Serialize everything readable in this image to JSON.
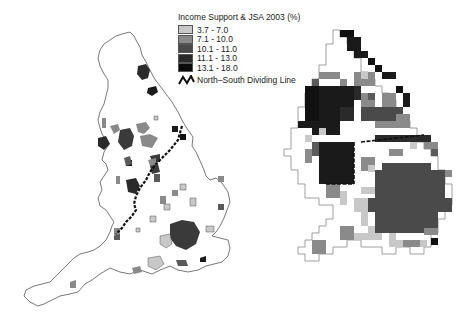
{
  "legend": {
    "title": "Income Support & JSA 2003 (%)",
    "classes": [
      {
        "label": "3.7  -  7.0",
        "color": "#c8c8c8"
      },
      {
        "label": "7.1  - 10.0",
        "color": "#8a8a8a"
      },
      {
        "label": "10.1 - 11.0",
        "color": "#4a4a4a"
      },
      {
        "label": "11.1 - 13.0",
        "color": "#2a2a2a"
      },
      {
        "label": "13.1 - 18.0",
        "color": "#0a0a0a"
      }
    ],
    "line_label": "North–South Dividing Line",
    "line_icon": "zigzag-line-icon"
  },
  "maps": {
    "left": {
      "name": "England geographic map",
      "outline_color": "#555555"
    },
    "right": {
      "name": "England grid cartogram",
      "outline_color": "#777777"
    }
  }
}
